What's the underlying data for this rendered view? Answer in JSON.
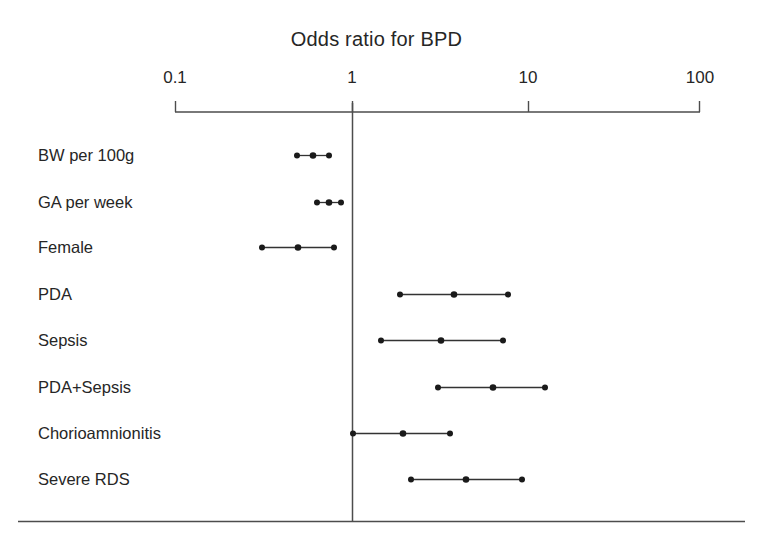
{
  "chart_data": {
    "type": "scatter",
    "title": "Odds ratio for BPD",
    "subtitle": "",
    "xlabel": "",
    "ylabel": "",
    "xscale": "log",
    "xlim": [
      0.1,
      100
    ],
    "grid": false,
    "legend": null,
    "reference_line": 1,
    "tick_labels": [
      "0.1",
      "1",
      "10",
      "100"
    ],
    "tick_values": [
      0.1,
      1,
      10,
      100
    ],
    "categories": [
      "BW per 100g",
      "GA per week",
      "Female",
      "PDA",
      "Sepsis",
      "PDA+Sepsis",
      "Chorioamnionitis",
      "Severe RDS"
    ],
    "series": [
      {
        "name": "Odds ratio (95% CI)",
        "points": [
          {
            "label": "BW per 100g",
            "estimate": 0.49,
            "low": 0.41,
            "high": 0.58
          },
          {
            "label": "GA per week",
            "estimate": 0.66,
            "low": 0.56,
            "high": 0.78
          },
          {
            "label": "Female",
            "estimate": 0.45,
            "low": 0.28,
            "high": 0.76
          },
          {
            "label": "PDA",
            "estimate": 3.8,
            "low": 1.9,
            "high": 7.4
          },
          {
            "label": "Sepsis",
            "estimate": 3.1,
            "low": 1.5,
            "high": 6.7
          },
          {
            "label": "PDA+Sepsis",
            "estimate": 6.2,
            "low": 2.9,
            "high": 12.5
          },
          {
            "label": "Chorioamnionitis",
            "estimate": 1.9,
            "low": 1.0,
            "high": 3.5
          },
          {
            "label": "Severe RDS",
            "estimate": 4.4,
            "low": 2.1,
            "high": 8.4
          }
        ]
      }
    ],
    "colors": {
      "line": "#333333",
      "marker": "#1a1a1a",
      "axis": "#555555",
      "text": "#262626",
      "background": "#ffffff"
    }
  },
  "axis": {
    "ticks": [
      {
        "label": "0.1",
        "x": 175
      },
      {
        "label": "1",
        "x": 352
      },
      {
        "label": "10",
        "x": 528
      },
      {
        "label": "100",
        "x": 700
      }
    ]
  },
  "rows": [
    {
      "label": "BW per 100g",
      "y": 155,
      "label_x": 38,
      "cx_low": 297,
      "cx_est": 313,
      "cx_high": 329
    },
    {
      "label": "GA per week",
      "y": 202,
      "label_x": 38,
      "cx_low": 317,
      "cx_est": 329,
      "cx_high": 341
    },
    {
      "label": "Female",
      "y": 247,
      "label_x": 38,
      "cx_low": 262,
      "cx_est": 298,
      "cx_high": 334
    },
    {
      "label": "PDA",
      "y": 294,
      "label_x": 38,
      "cx_low": 400,
      "cx_est": 454,
      "cx_high": 508
    },
    {
      "label": "Sepsis",
      "y": 340,
      "label_x": 38,
      "cx_low": 381,
      "cx_est": 441,
      "cx_high": 503
    },
    {
      "label": "PDA+Sepsis",
      "y": 387,
      "label_x": 38,
      "cx_low": 438,
      "cx_est": 493,
      "cx_high": 545
    },
    {
      "label": "Chorioamnionitis",
      "y": 433,
      "label_x": 38,
      "cx_low": 353,
      "cx_est": 403,
      "cx_high": 450
    },
    {
      "label": "Severe RDS",
      "y": 479,
      "label_x": 38,
      "cx_low": 411,
      "cx_est": 466,
      "cx_high": 522
    }
  ]
}
